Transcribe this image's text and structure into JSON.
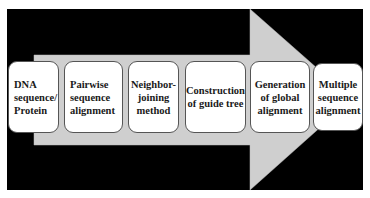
{
  "diagram": {
    "type": "process-flow",
    "colors": {
      "background": "#000000",
      "arrow": "#cfcfcf",
      "box_fill": "#ffffff",
      "box_border": "#555555",
      "text": "#1a1a1a"
    },
    "steps": [
      {
        "label": "DNA\nsequence/\nProtein"
      },
      {
        "label": "Pairwise\nsequence\nalignment"
      },
      {
        "label": "Neighbor-\njoining\nmethod"
      },
      {
        "label": "Construction\nof guide tree"
      },
      {
        "label": "Generation\nof global\nalignment"
      },
      {
        "label": "Multiple\nsequence\nalignment"
      }
    ]
  }
}
